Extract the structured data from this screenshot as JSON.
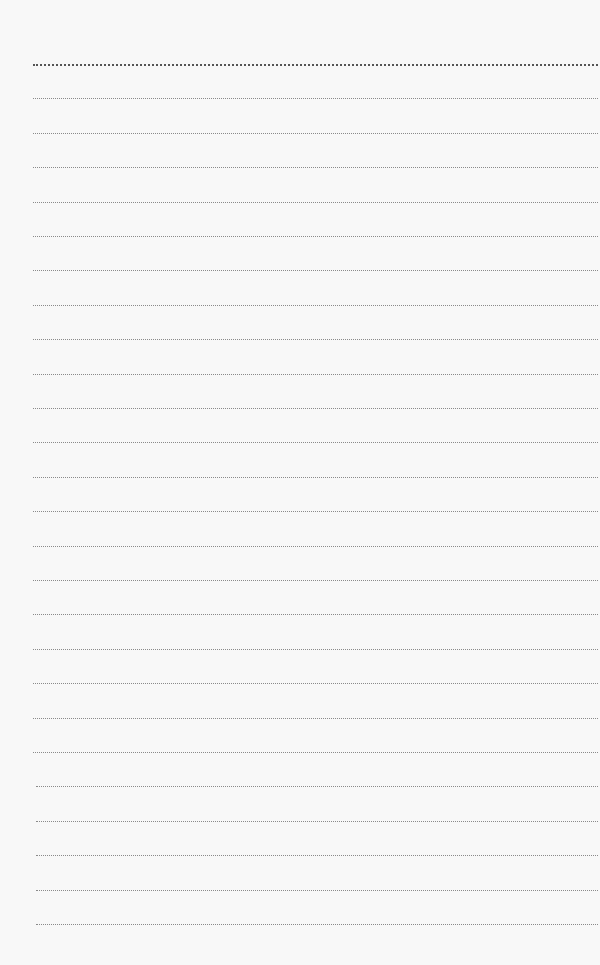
{
  "page": {
    "type": "lined-paper",
    "background_color": "#f8f8f8",
    "line_color": "#8a8a8a",
    "first_line_color": "#555555",
    "line_count": 26,
    "first_line_y": 64,
    "line_spacing": 34.4,
    "line_left": 33,
    "line_right": 598
  }
}
